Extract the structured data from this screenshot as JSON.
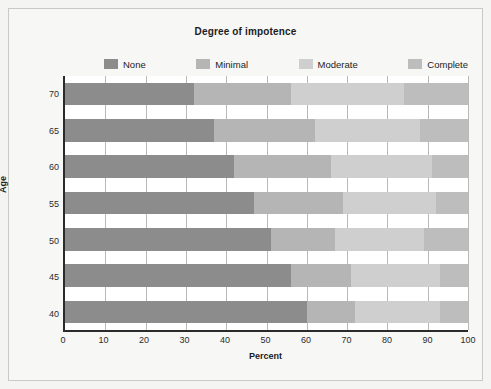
{
  "chart_data": {
    "type": "bar",
    "orientation": "horizontal",
    "stacked": true,
    "normalized_percent": true,
    "title": "Degree of impotence",
    "xlabel": "Percent",
    "ylabel": "Age",
    "xlim": [
      0,
      100
    ],
    "xticks": [
      0,
      10,
      20,
      30,
      40,
      50,
      60,
      70,
      80,
      90,
      100
    ],
    "categories": [
      "70",
      "65",
      "60",
      "55",
      "50",
      "45",
      "40"
    ],
    "grid": "vertical",
    "legend_position": "top",
    "series": [
      {
        "name": "None",
        "color": "#8c8c8c",
        "values": [
          32,
          37,
          42,
          47,
          51,
          56,
          60
        ]
      },
      {
        "name": "Minimal",
        "color": "#b5b5b5",
        "values": [
          24,
          25,
          24,
          22,
          16,
          15,
          12
        ]
      },
      {
        "name": "Moderate",
        "color": "#cfcfcf",
        "values": [
          28,
          26,
          25,
          23,
          22,
          22,
          21
        ]
      },
      {
        "name": "Complete",
        "color": "#bdbdbd",
        "values": [
          16,
          12,
          9,
          8,
          11,
          7,
          7
        ]
      }
    ]
  },
  "colors": {
    "background": "#f4f4f2",
    "plot_background": "#ffffff",
    "axis": "#2b2b2b",
    "gridline": "#b9b9b6",
    "frame_border": "#c9c9c6"
  }
}
